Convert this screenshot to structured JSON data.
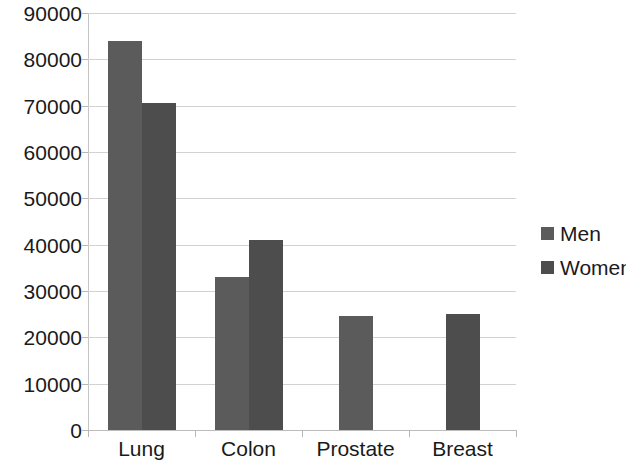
{
  "chart_data": {
    "type": "bar",
    "title": "",
    "subtitle": "",
    "xlabel": "",
    "ylabel": "",
    "categories": [
      "Lung",
      "Colon",
      "Prostate",
      "Breast"
    ],
    "series": [
      {
        "name": "Men",
        "color": "#5b5b5b",
        "values": [
          84000,
          33000,
          24500,
          null
        ]
      },
      {
        "name": "Women",
        "color": "#4d4d4d",
        "values": [
          70500,
          41000,
          null,
          25000
        ]
      }
    ],
    "ylim": [
      0,
      90000
    ],
    "ytick_step": 10000,
    "ytick_labels": [
      "0",
      "10000",
      "20000",
      "30000",
      "40000",
      "50000",
      "60000",
      "70000",
      "80000",
      "90000"
    ],
    "grid": true,
    "legend_position": "right",
    "legend_entries": [
      {
        "label": "Men",
        "color": "#5b5b5b"
      },
      {
        "label": "Women",
        "color": "#4d4d4d"
      }
    ]
  }
}
